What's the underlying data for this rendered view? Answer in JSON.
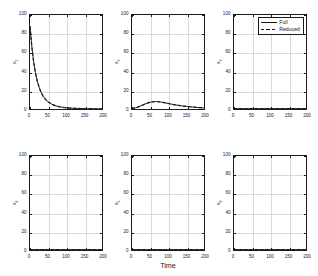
{
  "figure": {
    "xlabel": "Time",
    "legend": {
      "position": "top-right-of-panel-3",
      "entries": [
        {
          "label": "Full",
          "style": "solid",
          "color": "#1a1a1a"
        },
        {
          "label": "Reduced",
          "style": "dashed",
          "color": "#1a1a1a"
        }
      ]
    },
    "axis": {
      "xticks": [
        "0",
        "50",
        "100",
        "150",
        "200"
      ],
      "yticks": [
        "0",
        "20",
        "40",
        "60",
        "80",
        "100"
      ],
      "xlim": [
        0,
        200
      ],
      "ylim": [
        0,
        100
      ],
      "grid": true
    }
  },
  "chart_data": [
    {
      "type": "line",
      "panel": 1,
      "title": "",
      "xlabel": "",
      "ylabel": "x1",
      "ylabel_base": "x",
      "ylabel_sub": "1",
      "xlim": [
        0,
        200
      ],
      "ylim": [
        0,
        100
      ],
      "xticks": [
        0,
        50,
        100,
        150,
        200
      ],
      "yticks": [
        0,
        20,
        40,
        60,
        80,
        100
      ],
      "grid": true,
      "x": [
        0,
        5,
        10,
        15,
        20,
        25,
        30,
        35,
        40,
        45,
        50,
        60,
        70,
        80,
        90,
        100,
        110,
        120,
        130,
        140,
        150,
        160,
        170,
        180,
        190,
        200
      ],
      "series": [
        {
          "name": "Full",
          "style": "solid",
          "values": [
            88,
            66.5,
            50.5,
            38.8,
            30.0,
            23.4,
            18.4,
            14.6,
            11.7,
            9.4,
            7.7,
            5.2,
            3.6,
            2.5,
            1.8,
            1.3,
            1.0,
            0.8,
            0.6,
            0.5,
            0.4,
            0.35,
            0.3,
            0.25,
            0.2,
            0.2
          ]
        },
        {
          "name": "Reduced",
          "style": "dashed",
          "values": [
            88,
            66.5,
            50.5,
            38.8,
            30.0,
            23.4,
            18.4,
            14.6,
            11.7,
            9.4,
            7.7,
            5.2,
            3.6,
            2.5,
            1.8,
            1.3,
            1.0,
            0.8,
            0.6,
            0.5,
            0.4,
            0.35,
            0.3,
            0.25,
            0.2,
            0.2
          ]
        }
      ]
    },
    {
      "type": "line",
      "panel": 2,
      "title": "",
      "xlabel": "",
      "ylabel": "x2",
      "ylabel_base": "x",
      "ylabel_sub": "2",
      "xlim": [
        0,
        200
      ],
      "ylim": [
        0,
        100
      ],
      "xticks": [
        0,
        50,
        100,
        150,
        200
      ],
      "yticks": [
        0,
        20,
        40,
        60,
        80,
        100
      ],
      "grid": true,
      "x": [
        0,
        10,
        20,
        30,
        40,
        50,
        60,
        65,
        70,
        75,
        80,
        90,
        100,
        110,
        120,
        130,
        140,
        150,
        160,
        170,
        180,
        190,
        200
      ],
      "series": [
        {
          "name": "Full",
          "style": "solid",
          "values": [
            0.5,
            1.2,
            2.6,
            4.3,
            5.9,
            7.1,
            7.8,
            7.9,
            7.9,
            7.7,
            7.4,
            6.7,
            5.9,
            5.1,
            4.4,
            3.8,
            3.2,
            2.8,
            2.4,
            2.0,
            1.7,
            1.4,
            1.1
          ]
        },
        {
          "name": "Reduced",
          "style": "dashed",
          "values": [
            0.5,
            1.2,
            2.6,
            4.3,
            5.9,
            7.1,
            7.8,
            7.9,
            7.9,
            7.7,
            7.4,
            6.7,
            5.9,
            5.1,
            4.4,
            3.8,
            3.2,
            2.8,
            2.4,
            2.0,
            1.7,
            1.4,
            1.1
          ]
        }
      ]
    },
    {
      "type": "line",
      "panel": 3,
      "title": "",
      "xlabel": "",
      "ylabel": "x3",
      "ylabel_base": "x",
      "ylabel_sub": "3",
      "xlim": [
        0,
        200
      ],
      "ylim": [
        0,
        100
      ],
      "xticks": [
        0,
        50,
        100,
        150,
        200
      ],
      "yticks": [
        0,
        20,
        40,
        60,
        80,
        100
      ],
      "grid": true,
      "x": [
        0,
        25,
        50,
        75,
        100,
        125,
        150,
        175,
        200
      ],
      "series": [
        {
          "name": "Full",
          "style": "solid",
          "values": [
            0.4,
            0.4,
            0.4,
            0.4,
            0.4,
            0.4,
            0.4,
            0.4,
            0.4
          ]
        },
        {
          "name": "Reduced",
          "style": "dashed",
          "values": [
            0.4,
            0.4,
            0.4,
            0.4,
            0.4,
            0.4,
            0.4,
            0.4,
            0.4
          ]
        }
      ]
    },
    {
      "type": "line",
      "panel": 4,
      "title": "",
      "xlabel": "",
      "ylabel": "x4",
      "ylabel_base": "x",
      "ylabel_sub": "4",
      "xlim": [
        0,
        200
      ],
      "ylim": [
        0,
        100
      ],
      "xticks": [
        0,
        50,
        100,
        150,
        200
      ],
      "yticks": [
        0,
        20,
        40,
        60,
        80,
        100
      ],
      "grid": true,
      "x": [
        0,
        25,
        50,
        75,
        100,
        125,
        150,
        175,
        200
      ],
      "series": [
        {
          "name": "Full",
          "style": "solid",
          "values": [
            0.4,
            0.4,
            0.4,
            0.4,
            0.4,
            0.4,
            0.4,
            0.4,
            0.4
          ]
        },
        {
          "name": "Reduced",
          "style": "dashed",
          "values": [
            0.4,
            0.4,
            0.4,
            0.4,
            0.4,
            0.4,
            0.4,
            0.4,
            0.4
          ]
        }
      ]
    },
    {
      "type": "line",
      "panel": 5,
      "title": "",
      "xlabel": "Time",
      "ylabel": "x5",
      "ylabel_base": "x",
      "ylabel_sub": "5",
      "xlim": [
        0,
        200
      ],
      "ylim": [
        0,
        100
      ],
      "xticks": [
        0,
        50,
        100,
        150,
        200
      ],
      "yticks": [
        0,
        20,
        40,
        60,
        80,
        100
      ],
      "grid": true,
      "x": [
        0,
        25,
        50,
        75,
        100,
        125,
        150,
        175,
        200
      ],
      "series": [
        {
          "name": "Full",
          "style": "solid",
          "values": [
            0.4,
            0.4,
            0.4,
            0.4,
            0.4,
            0.4,
            0.4,
            0.4,
            0.4
          ]
        },
        {
          "name": "Reduced",
          "style": "dashed",
          "values": [
            0.4,
            0.4,
            0.4,
            0.4,
            0.4,
            0.4,
            0.4,
            0.4,
            0.4
          ]
        }
      ]
    },
    {
      "type": "line",
      "panel": 6,
      "title": "",
      "xlabel": "",
      "ylabel": "x6",
      "ylabel_base": "x",
      "ylabel_sub": "6",
      "xlim": [
        0,
        200
      ],
      "ylim": [
        0,
        100
      ],
      "xticks": [
        0,
        50,
        100,
        150,
        200
      ],
      "yticks": [
        0,
        20,
        40,
        60,
        80,
        100
      ],
      "grid": true,
      "x": [
        0,
        25,
        50,
        75,
        100,
        125,
        150,
        175,
        200
      ],
      "series": [
        {
          "name": "Full",
          "style": "solid",
          "values": [
            0.4,
            0.4,
            0.4,
            0.4,
            0.4,
            0.4,
            0.4,
            0.4,
            0.4
          ]
        },
        {
          "name": "Reduced",
          "style": "dashed",
          "values": [
            0.4,
            0.4,
            0.4,
            0.4,
            0.4,
            0.4,
            0.4,
            0.4,
            0.4
          ]
        }
      ]
    }
  ]
}
